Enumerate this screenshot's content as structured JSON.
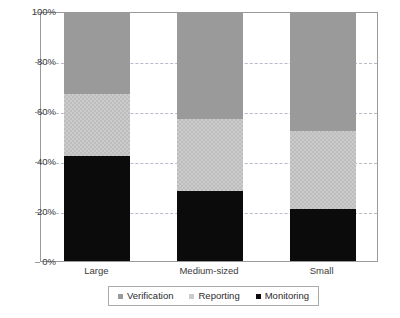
{
  "chart_data": {
    "type": "bar",
    "title": "",
    "subtitle": "",
    "xlabel": "",
    "ylabel": "",
    "stacked": true,
    "orientation": "vertical",
    "grid": true,
    "legend_position": "bottom",
    "ylim": [
      0,
      100
    ],
    "yticks": [
      0,
      20,
      40,
      60,
      80,
      100
    ],
    "ytick_labels": [
      "0%",
      "20%",
      "40%",
      "60%",
      "80%",
      "100%"
    ],
    "categories": [
      "Large",
      "Medium-sized",
      "Small"
    ],
    "series": [
      {
        "name": "Monitoring",
        "values": [
          42,
          28,
          21
        ],
        "color": "#0b0b0b"
      },
      {
        "name": "Reporting",
        "values": [
          25,
          29,
          31
        ],
        "color": "#cbcbcb"
      },
      {
        "name": "Verification",
        "values": [
          33,
          43,
          48
        ],
        "color": "#9a9a9a"
      }
    ]
  },
  "axis": {
    "y": {
      "ticks": [
        {
          "label": "100%",
          "value": 100
        },
        {
          "label": "80%",
          "value": 80
        },
        {
          "label": "60%",
          "value": 60
        },
        {
          "label": "40%",
          "value": 40
        },
        {
          "label": "20%",
          "value": 20
        },
        {
          "label": "0%",
          "value": 0
        }
      ]
    },
    "x": {
      "ticks": [
        {
          "label": "Large"
        },
        {
          "label": "Medium-sized"
        },
        {
          "label": "Small"
        }
      ]
    }
  },
  "legend": {
    "entries": [
      {
        "label": "Verification",
        "color": "#9a9a9a"
      },
      {
        "label": "Reporting",
        "color": "#cbcbcb"
      },
      {
        "label": "Monitoring",
        "color": "#0b0b0b"
      }
    ]
  },
  "colors": {
    "verification": "#9a9a9a",
    "reporting": "#cbcbcb",
    "monitoring": "#0b0b0b",
    "gridline": "#b9b9c9",
    "frame": "#9a9a9a",
    "text": "#3a3a3a",
    "background": "#ffffff"
  }
}
